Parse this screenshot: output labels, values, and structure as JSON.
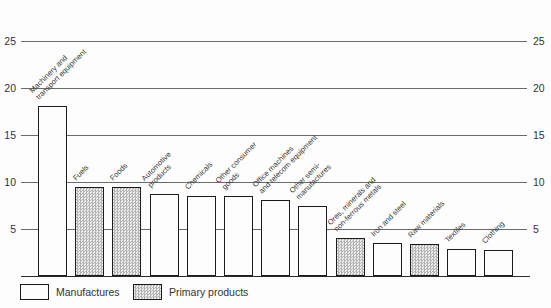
{
  "chart_data": {
    "type": "bar",
    "title": "",
    "xlabel": "",
    "ylabel": "",
    "ylim": [
      0,
      25
    ],
    "yticks": [
      5,
      10,
      15,
      20,
      25
    ],
    "grid": true,
    "y_axis_labels_both_sides": true,
    "legend_position": "bottom-left",
    "legend": [
      {
        "label": "Manufactures",
        "fill": "white"
      },
      {
        "label": "Primary products",
        "fill": "hatched"
      }
    ],
    "bars": [
      {
        "label": "Machinery and transport equipment",
        "lines": [
          "Machinery and",
          "transport equipment"
        ],
        "value": 18.0,
        "group": "Manufactures"
      },
      {
        "label": "Fuels",
        "lines": [
          "Fuels"
        ],
        "value": 9.4,
        "group": "Primary products"
      },
      {
        "label": "Foods",
        "lines": [
          "Foods"
        ],
        "value": 9.4,
        "group": "Primary products"
      },
      {
        "label": "Automotive products",
        "lines": [
          "Automotive",
          "products"
        ],
        "value": 8.7,
        "group": "Manufactures"
      },
      {
        "label": "Chemicals",
        "lines": [
          "Chemicals"
        ],
        "value": 8.5,
        "group": "Manufactures"
      },
      {
        "label": "Other consumer goods",
        "lines": [
          "Other consumer",
          "goods"
        ],
        "value": 8.5,
        "group": "Manufactures"
      },
      {
        "label": "Office machines and telecom equipment",
        "lines": [
          "Office machines",
          "and telecom equipment"
        ],
        "value": 8.1,
        "group": "Manufactures"
      },
      {
        "label": "Other semi-manufactures",
        "lines": [
          "Other semi-",
          "manufactures"
        ],
        "value": 7.4,
        "group": "Manufactures"
      },
      {
        "label": "Ores, minerals and non-ferrous metals",
        "lines": [
          "Ores, minerals and",
          "non-ferrous metals"
        ],
        "value": 4.0,
        "group": "Primary products"
      },
      {
        "label": "Iron and steel",
        "lines": [
          "Iron and steel"
        ],
        "value": 3.5,
        "group": "Manufactures"
      },
      {
        "label": "Raw materials",
        "lines": [
          "Raw materials"
        ],
        "value": 3.4,
        "group": "Primary products"
      },
      {
        "label": "Textiles",
        "lines": [
          "Textiles"
        ],
        "value": 2.9,
        "group": "Manufactures"
      },
      {
        "label": "Clothing",
        "lines": [
          "Clothing"
        ],
        "value": 2.8,
        "group": "Manufactures"
      }
    ]
  },
  "colors": {
    "background": "#fdfdfd",
    "bar_border": "#1b1b1b",
    "gridline": "#6a6a6a",
    "text": "#333333",
    "hatch_dark": "#b4b4b4",
    "hatch_light": "#ededed"
  }
}
